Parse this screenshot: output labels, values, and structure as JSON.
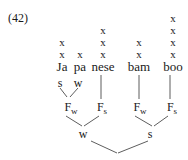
{
  "example_number": "(42)",
  "syllables": [
    {
      "text": "Ja",
      "x": 62,
      "grid_height": 2
    },
    {
      "text": "pa",
      "x": 80,
      "grid_height": 1
    },
    {
      "text": "nese",
      "x": 103,
      "grid_height": 3
    },
    {
      "text": "bam",
      "x": 139,
      "grid_height": 2
    },
    {
      "text": "boo",
      "x": 173,
      "grid_height": 4
    }
  ],
  "grid_mark": "x",
  "syllable_labels": {
    "ja": "s",
    "pa": "w"
  },
  "feet": [
    {
      "label": "F",
      "sub": "w",
      "x": 71
    },
    {
      "label": "F",
      "sub": "s",
      "x": 102
    },
    {
      "label": "F",
      "sub": "w",
      "x": 139
    },
    {
      "label": "F",
      "sub": "s",
      "x": 173
    }
  ],
  "phrase_labels": {
    "left": "w",
    "right": "s"
  }
}
